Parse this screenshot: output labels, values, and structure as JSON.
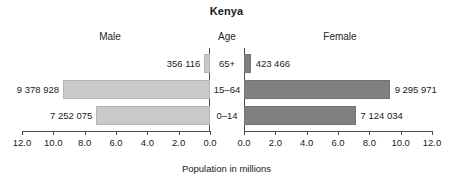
{
  "chart_data": {
    "type": "bar",
    "subtype": "population-pyramid",
    "title": "Kenya",
    "xlabel": "Population in millions",
    "ylabel": "Age",
    "categories": [
      "65+",
      "15–64",
      "0–14"
    ],
    "xlim": [
      0,
      12
    ],
    "xticks": [
      0.0,
      2.0,
      4.0,
      6.0,
      8.0,
      10.0,
      12.0
    ],
    "xtick_labels": [
      "0.0",
      "2.0",
      "4.0",
      "6.0",
      "8.0",
      "10.0",
      "12.0"
    ],
    "grid": false,
    "legend_position": "none",
    "series": [
      {
        "name": "Male",
        "side": "left",
        "color": "#c9c9c9",
        "values": [
          0.356116,
          9.378928,
          7.252075
        ],
        "data_labels": [
          "356 116",
          "9 378 928",
          "7 252 075"
        ]
      },
      {
        "name": "Female",
        "side": "right",
        "color": "#808080",
        "values": [
          0.423466,
          9.295971,
          7.124034
        ],
        "data_labels": [
          "423 466",
          "9 295 971",
          "7 124 034"
        ]
      }
    ]
  },
  "chart": {
    "title": "Kenya",
    "header_male": "Male",
    "header_age": "Age",
    "header_female": "Female",
    "xaxis_title": "Population in millions",
    "age_labels": [
      "65+",
      "15–64",
      "0–14"
    ],
    "male_labels": [
      "356 116",
      "9 378 928",
      "7 252 075"
    ],
    "female_labels": [
      "423 466",
      "9 295 971",
      "7 124 034"
    ],
    "tick_labels_left": [
      "12.0",
      "10.0",
      "8.0",
      "6.0",
      "4.0",
      "2.0",
      "0.0"
    ],
    "tick_labels_right": [
      "0.0",
      "2.0",
      "4.0",
      "6.0",
      "8.0",
      "10.0",
      "12.0"
    ],
    "colors": {
      "male_bar": "#c9c9c9",
      "female_bar": "#808080",
      "axis": "#4d4d4d",
      "text": "#1a1a1a",
      "background": "#ffffff"
    }
  }
}
